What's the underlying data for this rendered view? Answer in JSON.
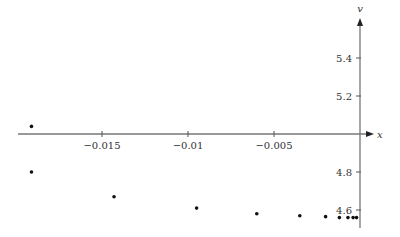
{
  "chart_data": {
    "type": "scatter",
    "title": "",
    "xlabel": "x",
    "ylabel": "v",
    "xlim": [
      -0.0206,
      0.0008
    ],
    "ylim": [
      4.53,
      5.62
    ],
    "x_ticks": [
      -0.015,
      -0.01,
      -0.005
    ],
    "x_tick_labels": [
      "−0.015",
      "−0.01",
      "−0.005"
    ],
    "y_ticks": [
      5.4,
      5.2,
      4.8,
      4.6
    ],
    "y_tick_labels": [
      "5.4",
      "5.2",
      "4.8",
      "4.6"
    ],
    "x_axis_at_y": 5.0,
    "y_axis_at_x": 0,
    "grid": false,
    "legend": null,
    "series": [
      {
        "name": "points",
        "color": "#111111",
        "points": [
          {
            "x": -0.0191,
            "y": 5.04
          },
          {
            "x": -0.0191,
            "y": 4.8
          },
          {
            "x": -0.0143,
            "y": 4.67
          },
          {
            "x": -0.0095,
            "y": 4.61
          },
          {
            "x": -0.006,
            "y": 4.58
          },
          {
            "x": -0.0035,
            "y": 4.57
          },
          {
            "x": -0.002,
            "y": 4.565
          },
          {
            "x": -0.0012,
            "y": 4.56
          },
          {
            "x": -0.0007,
            "y": 4.56
          },
          {
            "x": -0.0004,
            "y": 4.56
          },
          {
            "x": -0.0002,
            "y": 4.56
          }
        ]
      }
    ]
  }
}
